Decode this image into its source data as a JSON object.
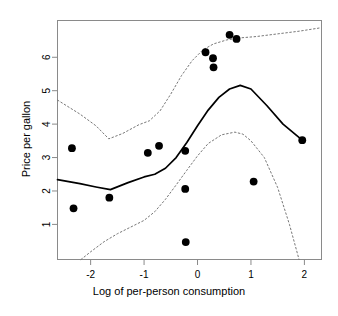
{
  "chart_data": {
    "type": "scatter",
    "title": "",
    "xlabel": "Log of per-person consumption",
    "ylabel": "Price per gallon",
    "xlim": [
      -2.62,
      2.32
    ],
    "ylim": [
      -0.05,
      7.1
    ],
    "xticks": [
      -2,
      -1,
      0,
      1,
      2
    ],
    "xticklabels": [
      "-2",
      "-1",
      "0",
      "1",
      "2"
    ],
    "yticks": [
      1,
      2,
      3,
      4,
      5,
      6
    ],
    "yticklabels": [
      "1",
      "2",
      "3",
      "4",
      "5",
      "6"
    ],
    "grid": false,
    "legend": null,
    "box": true,
    "points": [
      {
        "x": -2.35,
        "y": 3.28
      },
      {
        "x": -2.32,
        "y": 1.48
      },
      {
        "x": -1.65,
        "y": 1.8
      },
      {
        "x": -0.93,
        "y": 3.14
      },
      {
        "x": -0.72,
        "y": 3.35
      },
      {
        "x": -0.23,
        "y": 3.2
      },
      {
        "x": -0.23,
        "y": 2.06
      },
      {
        "x": -0.22,
        "y": 0.47
      },
      {
        "x": 0.15,
        "y": 6.15
      },
      {
        "x": 0.29,
        "y": 5.97
      },
      {
        "x": 0.3,
        "y": 5.7
      },
      {
        "x": 0.6,
        "y": 6.67
      },
      {
        "x": 0.73,
        "y": 6.55
      },
      {
        "x": 1.05,
        "y": 2.28
      },
      {
        "x": 1.96,
        "y": 3.52
      }
    ],
    "series": [
      {
        "name": "smoothed fit",
        "style": "solid",
        "x": [
          -2.62,
          -2.2,
          -1.9,
          -1.63,
          -1.3,
          -1.0,
          -0.8,
          -0.6,
          -0.4,
          -0.2,
          0.0,
          0.2,
          0.4,
          0.6,
          0.8,
          1.0,
          1.3,
          1.6,
          1.96
        ],
        "y": [
          2.34,
          2.22,
          2.12,
          2.04,
          2.25,
          2.42,
          2.5,
          2.68,
          3.0,
          3.45,
          3.95,
          4.42,
          4.8,
          5.05,
          5.16,
          5.05,
          4.55,
          4.0,
          3.52
        ]
      },
      {
        "name": "upper confidence band",
        "style": "dotted",
        "x": [
          -2.62,
          -2.2,
          -1.9,
          -1.66,
          -1.4,
          -1.1,
          -0.9,
          -0.7,
          -0.5,
          -0.3,
          -0.1,
          0.1,
          0.3,
          0.55,
          0.8,
          1.1,
          1.5,
          1.9,
          2.3
        ],
        "y": [
          4.72,
          4.3,
          3.95,
          3.56,
          3.72,
          3.98,
          4.1,
          4.4,
          4.9,
          5.45,
          5.9,
          6.22,
          6.4,
          6.52,
          6.58,
          6.62,
          6.7,
          6.78,
          6.88
        ]
      },
      {
        "name": "lower confidence band",
        "style": "dotted",
        "x": [
          -2.18,
          -2.0,
          -1.75,
          -1.5,
          -1.25,
          -1.0,
          -0.8,
          -0.6,
          -0.4,
          -0.2,
          0.0,
          0.2,
          0.45,
          0.7,
          0.85,
          1.0,
          1.25,
          1.5,
          1.72,
          1.9
        ],
        "y": [
          -0.05,
          0.18,
          0.48,
          0.72,
          0.92,
          1.12,
          1.38,
          1.75,
          2.18,
          2.62,
          3.05,
          3.42,
          3.68,
          3.76,
          3.7,
          3.5,
          3.0,
          2.1,
          1.0,
          -0.05
        ]
      }
    ]
  },
  "figure": {
    "xlabel": "Log of per-person consumption",
    "ylabel": "Price per gallon"
  }
}
